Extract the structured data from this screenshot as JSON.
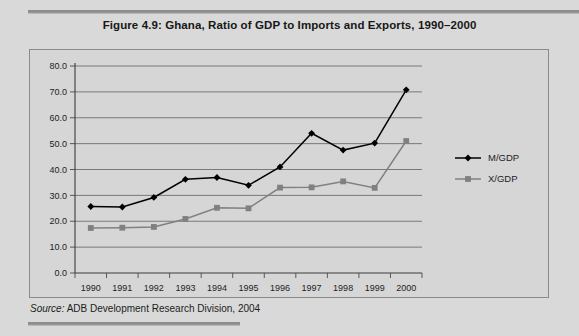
{
  "figure": {
    "title": "Figure 4.9:  Ghana, Ratio of GDP to Imports and Exports, 1990–2000",
    "source_label": "Source:",
    "source_text": " ADB Development Research Division, 2004"
  },
  "chart_data": {
    "type": "line",
    "title": "Figure 4.9:  Ghana, Ratio of GDP to Imports and Exports, 1990–2000",
    "xlabel": "",
    "ylabel": "",
    "x": [
      "1990",
      "1991",
      "1992",
      "1993",
      "1994",
      "1995",
      "1996",
      "1997",
      "1998",
      "1999",
      "2000"
    ],
    "categories": [
      "1990",
      "1991",
      "1992",
      "1993",
      "1994",
      "1995",
      "1996",
      "1997",
      "1998",
      "1999",
      "2000"
    ],
    "series": [
      {
        "name": "M/GDP",
        "color": "#000000",
        "marker": "diamond",
        "values": [
          25.7,
          25.5,
          29.2,
          36.2,
          36.9,
          33.9,
          41.0,
          54.0,
          47.5,
          50.2,
          70.8
        ]
      },
      {
        "name": "X/GDP",
        "color": "#808080",
        "marker": "square",
        "values": [
          17.4,
          17.5,
          17.8,
          20.9,
          25.2,
          25.0,
          33.0,
          33.1,
          35.4,
          32.9,
          51.0
        ]
      }
    ],
    "ylim": [
      0,
      80
    ],
    "yticks": [
      0,
      10,
      20,
      30,
      40,
      50,
      60,
      70,
      80
    ],
    "ytick_labels": [
      "0.0",
      "10.0",
      "20.0",
      "30.0",
      "40.0",
      "50.0",
      "60.0",
      "70.0",
      "80.0"
    ],
    "grid": true,
    "grid_axis": "y",
    "legend_position": "right",
    "plot_background": "#d6d6d6"
  }
}
